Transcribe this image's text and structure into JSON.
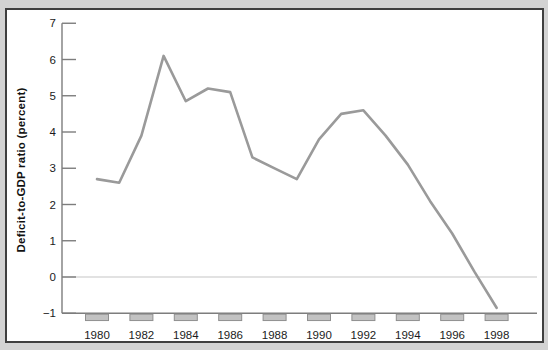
{
  "figure": {
    "outer_background": "#d3d3d3",
    "frame_border_color": "#3f3f3f",
    "frame_fill": "#ffffff"
  },
  "chart_data": {
    "type": "line",
    "ylabel": "Deficit-to-GDP ratio (percent)",
    "xlabel": "",
    "x": [
      1980,
      1981,
      1982,
      1983,
      1984,
      1985,
      1986,
      1987,
      1988,
      1989,
      1990,
      1991,
      1992,
      1993,
      1994,
      1995,
      1996,
      1997,
      1998
    ],
    "series": [
      {
        "name": "deficit-to-gdp-ratio",
        "values": [
          2.7,
          2.6,
          3.9,
          6.1,
          4.85,
          5.2,
          5.1,
          3.3,
          3.0,
          2.7,
          3.8,
          4.5,
          4.6,
          3.9,
          3.1,
          2.1,
          1.2,
          0.15,
          -0.85
        ]
      }
    ],
    "x_tick_labels": [
      "1980",
      "1982",
      "1984",
      "1986",
      "1988",
      "1990",
      "1992",
      "1994",
      "1996",
      "1998"
    ],
    "y_ticks": [
      7,
      6,
      5,
      4,
      3,
      2,
      1,
      0,
      -1
    ],
    "y_tick_labels": [
      "7",
      "6",
      "5",
      "4",
      "3",
      "2",
      "1",
      "0",
      "−1"
    ],
    "ylim": [
      -1,
      7
    ],
    "grid": "horizontal line at zero only",
    "legend": "none",
    "colors": {
      "line": "#9a9a9a",
      "axis": "#7d7d7d",
      "zero_line": "#c6c6c6",
      "tick_box_fill": "#c2c2c2",
      "tick_box_stroke": "#8f8f8f",
      "label_text": "#1b1b1b"
    }
  }
}
